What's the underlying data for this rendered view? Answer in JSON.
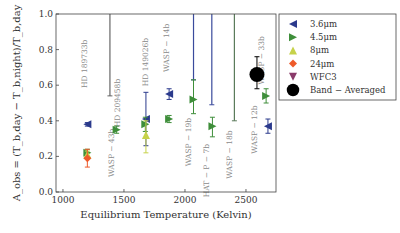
{
  "chart_data": {
    "type": "scatter",
    "title": "",
    "xlabel": "Equilibrium Temperature (Kelvin)",
    "ylabel": "A_obs = (T_b,day − T_b,night)/T_b,day",
    "xlim": [
      943,
      2746
    ],
    "ylim": [
      0.0,
      1.0
    ],
    "xticks": [
      1000,
      1500,
      2000,
      2500
    ],
    "yticks": [
      0.0,
      0.2,
      0.4,
      0.6,
      0.8,
      1.0
    ],
    "xtick_labels": [
      "1000",
      "1500",
      "2000",
      "2500"
    ],
    "ytick_labels": [
      "0.0",
      "0.2",
      "0.4",
      "0.6",
      "0.8",
      "1.0"
    ],
    "grid": false,
    "legend": {
      "placement": "top-right-outside",
      "entries": [
        {
          "name": "3.6μm",
          "marker": "triangle-left",
          "color": "#2b3a8c"
        },
        {
          "name": "4.5μm",
          "marker": "triangle-right",
          "color": "#3e8e3a"
        },
        {
          "name": "8μm",
          "marker": "triangle-up",
          "color": "#c6d24a"
        },
        {
          "name": "24μm",
          "marker": "diamond",
          "color": "#ee5a2a"
        },
        {
          "name": "WFC3",
          "marker": "triangle-down",
          "color": "#8a3a6a"
        },
        {
          "name": "Band − Averaged",
          "marker": "circle",
          "color": "#000000"
        }
      ]
    },
    "series": [
      {
        "name": "3.6μm",
        "points": [
          {
            "x": 1200,
            "y": 0.38,
            "ylo": 0.37,
            "yhi": 0.39
          },
          {
            "x": 1680,
            "y": 0.41,
            "ylo": 0.26,
            "yhi": 0.56
          },
          {
            "x": 1870,
            "y": 0.55,
            "ylo": 0.52,
            "yhi": 0.58
          },
          {
            "x": 2680,
            "y": 0.37,
            "ylo": 0.33,
            "yhi": 0.41
          }
        ]
      },
      {
        "name": "4.5μm",
        "points": [
          {
            "x": 1200,
            "y": 0.22,
            "ylo": 0.2,
            "yhi": 0.24
          },
          {
            "x": 1440,
            "y": 0.35,
            "ylo": 0.33,
            "yhi": 0.37
          },
          {
            "x": 1675,
            "y": 0.38,
            "ylo": 0.34,
            "yhi": 0.42
          },
          {
            "x": 1870,
            "y": 0.41,
            "ylo": 0.39,
            "yhi": 0.43
          },
          {
            "x": 2070,
            "y": 0.52,
            "ylo": 0.44,
            "yhi": 0.63
          },
          {
            "x": 2225,
            "y": 0.37,
            "ylo": 0.31,
            "yhi": 0.42
          },
          {
            "x": 2665,
            "y": 0.54,
            "ylo": 0.5,
            "yhi": 0.58
          }
        ]
      },
      {
        "name": "8μm",
        "points": [
          {
            "x": 1200,
            "y": 0.21,
            "ylo": 0.19,
            "yhi": 0.23
          },
          {
            "x": 1680,
            "y": 0.32,
            "ylo": 0.22,
            "yhi": 0.4
          }
        ]
      },
      {
        "name": "24μm",
        "points": [
          {
            "x": 1200,
            "y": 0.19,
            "ylo": 0.14,
            "yhi": 0.24
          }
        ]
      },
      {
        "name": "Band − Averaged",
        "points": [
          {
            "x": 2590,
            "y": 0.66,
            "ylo": 0.58,
            "yhi": 0.76
          }
        ]
      }
    ],
    "limit_lines": [
      {
        "x": 1385,
        "color": "#666666",
        "ylo": 0.54,
        "yhi": 1.0
      },
      {
        "x": 2070,
        "color": "#3a4a9c",
        "ylo": 0.63,
        "yhi": 1.0
      },
      {
        "x": 2220,
        "color": "#3a4a9c",
        "ylo": 0.49,
        "yhi": 1.0
      },
      {
        "x": 2405,
        "color": "#5a7a5a",
        "ylo": 0.4,
        "yhi": 1.0
      }
    ],
    "annotations": [
      {
        "text": "HD 189733b",
        "x": 1200,
        "y": 0.72
      },
      {
        "text": "WASP − 43b",
        "x": 1415,
        "y": 0.22
      },
      {
        "text": "HD 209458b",
        "x": 1470,
        "y": 0.5
      },
      {
        "text": "HD 149026b",
        "x": 1700,
        "y": 0.73
      },
      {
        "text": "WASP − 14b",
        "x": 1870,
        "y": 0.81
      },
      {
        "text": "WASP − 19b",
        "x": 2050,
        "y": 0.28
      },
      {
        "text": "HAT − P − 7b",
        "x": 2200,
        "y": 0.12
      },
      {
        "text": "WASP − 18b",
        "x": 2385,
        "y": 0.21
      },
      {
        "text": "WASP − 12b",
        "x": 2590,
        "y": 0.35
      },
      {
        "text": "WASP − 33b",
        "x": 2645,
        "y": 0.74
      }
    ]
  }
}
